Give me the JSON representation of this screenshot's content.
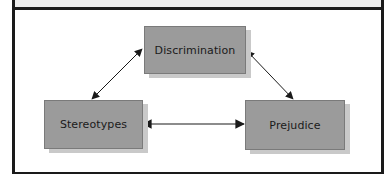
{
  "diagram": {
    "type": "triangle-relationship",
    "colors": {
      "node_fill": "#9b9b9b",
      "node_shadow": "#c9c9c9",
      "frame_border": "#1a1a1a",
      "header_bar": "#ececec",
      "arrow": "#1a1a1a"
    },
    "nodes": [
      {
        "id": "discrimination",
        "label": "Discrimination"
      },
      {
        "id": "stereotypes",
        "label": "Stereotypes"
      },
      {
        "id": "prejudice",
        "label": "Prejudice"
      }
    ],
    "edges": [
      {
        "from": "discrimination",
        "to": "stereotypes",
        "direction": "bidirectional"
      },
      {
        "from": "discrimination",
        "to": "prejudice",
        "direction": "bidirectional"
      },
      {
        "from": "stereotypes",
        "to": "prejudice",
        "direction": "bidirectional"
      }
    ]
  }
}
